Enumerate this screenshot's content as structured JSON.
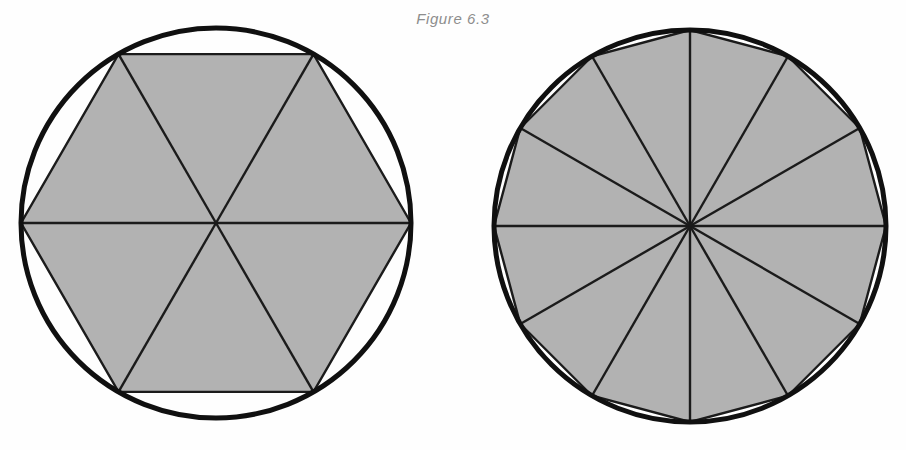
{
  "page": {
    "width": 906,
    "height": 450,
    "background_color": "#fefefe"
  },
  "caption": {
    "text": "Figure 6.3",
    "color": "#8d8d8d",
    "style": "italic"
  },
  "style": {
    "fill_color": "#b2b2b2",
    "line_color": "#1b1b1b",
    "circle_color": "#101010",
    "circle_stroke_width": 5,
    "polygon_stroke_width": 2.4
  },
  "chart_data": {
    "type": "diagram",
    "title": "Figure 6.3",
    "figures": [
      {
        "name": "hexagon-in-circle",
        "label": "Circle with inscribed regular hexagon",
        "sides": 6,
        "triangles": 6,
        "center": [
          216,
          223
        ],
        "radius": 195,
        "start_angle_deg": 0,
        "central_angle_deg": 60,
        "vertex_angles_deg": [
          0,
          60,
          120,
          180,
          240,
          300
        ],
        "fill": "#b2b2b2"
      },
      {
        "name": "dodecagon-in-circle",
        "label": "Circle with inscribed regular 12-gon",
        "sides": 12,
        "triangles": 12,
        "center": [
          690,
          226
        ],
        "radius": 196,
        "start_angle_deg": 90,
        "central_angle_deg": 30,
        "vertex_angles_deg": [
          90,
          120,
          150,
          180,
          210,
          240,
          270,
          300,
          330,
          0,
          30,
          60
        ],
        "fill": "#b2b2b2"
      }
    ]
  }
}
